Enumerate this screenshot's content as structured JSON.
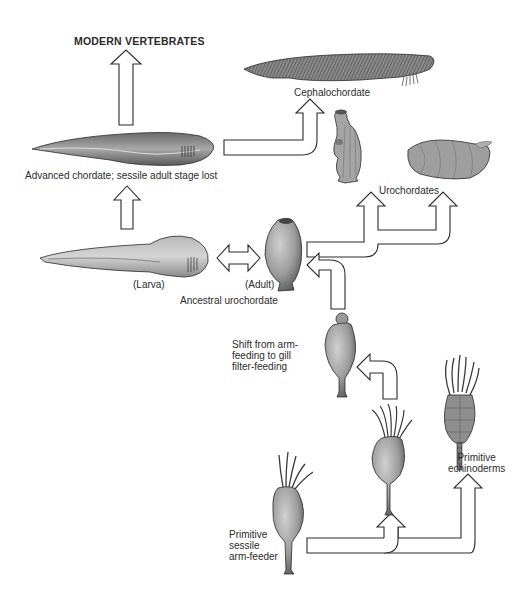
{
  "diagram": {
    "labels": {
      "modern_vertebrates": "MODERN VERTEBRATES",
      "cephalochordate": "Cephalochordate",
      "advanced_chordate": "Advanced chordate; sessile adult stage lost",
      "urochordates": "Urochordates",
      "larva": "(Larva)",
      "adult": "(Adult)",
      "ancestral_urochordate": "Ancestral urochordate",
      "shift_feeding": "Shift from arm-\nfeeding to gill\nfilter-feeding",
      "primitive_echinoderms": "Primitive\nechinoderms",
      "primitive_arm_feeder": "Primitive\nsessile\narm-feeder"
    },
    "nodes": [
      {
        "id": "arm-feeder",
        "label": "Primitive sessile arm-feeder"
      },
      {
        "id": "intermediate-arm-feeder",
        "label": ""
      },
      {
        "id": "echinoderms",
        "label": "Primitive echinoderms"
      },
      {
        "id": "gill-feeder",
        "label": "Shift from arm-feeding to gill filter-feeding"
      },
      {
        "id": "ancestral-urochordate-adult",
        "label": "(Adult)"
      },
      {
        "id": "ancestral-urochordate-larva",
        "label": "(Larva)"
      },
      {
        "id": "urochordates",
        "label": "Urochordates"
      },
      {
        "id": "cephalochordate",
        "label": "Cephalochordate"
      },
      {
        "id": "advanced-chordate",
        "label": "Advanced chordate; sessile adult stage lost"
      },
      {
        "id": "modern-vertebrates",
        "label": "MODERN VERTEBRATES"
      }
    ],
    "edges": [
      {
        "from": "arm-feeder",
        "to": "intermediate-arm-feeder"
      },
      {
        "from": "arm-feeder",
        "to": "echinoderms"
      },
      {
        "from": "intermediate-arm-feeder",
        "to": "gill-feeder"
      },
      {
        "from": "gill-feeder",
        "to": "ancestral-urochordate-adult"
      },
      {
        "from": "ancestral-urochordate-adult",
        "to": "ancestral-urochordate-larva",
        "bidirectional": true
      },
      {
        "from": "ancestral-urochordate-adult",
        "to": "urochordates",
        "count": 2
      },
      {
        "from": "ancestral-urochordate-larva",
        "to": "advanced-chordate"
      },
      {
        "from": "advanced-chordate",
        "to": "cephalochordate"
      },
      {
        "from": "advanced-chordate",
        "to": "modern-vertebrates"
      }
    ],
    "colors": {
      "ink": "#2b2b2b",
      "organism_fill": "#9a9a9a",
      "organism_dark": "#5a5a5a",
      "organism_light": "#c8c8c8",
      "arrow_fill": "#ffffff",
      "background": "#ffffff"
    }
  }
}
